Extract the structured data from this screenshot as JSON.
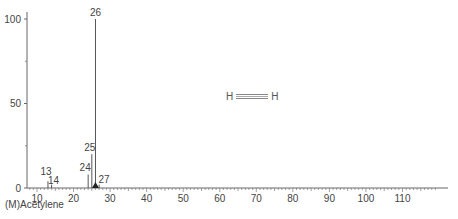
{
  "compound": {
    "name_label": "(M)Acetylene",
    "structure": {
      "left_atom": "H",
      "right_atom": "H",
      "bond": "triple"
    }
  },
  "chart_data": {
    "type": "bar",
    "title": "",
    "xlabel": "",
    "ylabel": "",
    "xlim": [
      8,
      120
    ],
    "ylim": [
      0,
      100
    ],
    "x_ticks": [
      10,
      20,
      30,
      40,
      50,
      60,
      70,
      80,
      90,
      100,
      110
    ],
    "y_ticks": [
      0,
      50,
      100
    ],
    "grid": false,
    "peaks": [
      {
        "mz": 13,
        "intensity": 4,
        "label": "13"
      },
      {
        "mz": 14,
        "intensity": 2,
        "label": "14"
      },
      {
        "mz": 24,
        "intensity": 8,
        "label": "24"
      },
      {
        "mz": 25,
        "intensity": 20,
        "label": "25"
      },
      {
        "mz": 26,
        "intensity": 100,
        "label": "26"
      },
      {
        "mz": 27,
        "intensity": 2,
        "label": "27"
      }
    ],
    "molecular_ion_marker": 26
  }
}
